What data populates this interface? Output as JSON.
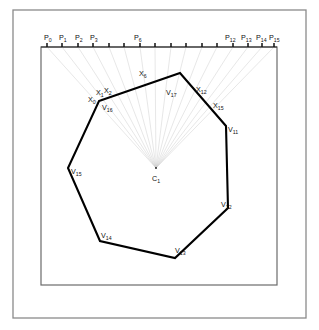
{
  "figure": {
    "center_label": "C",
    "center_sub": "1",
    "frame": {
      "outer": {
        "x": 13,
        "y": 10,
        "w": 293,
        "h": 308
      },
      "inner": {
        "x": 41,
        "y": 47,
        "w": 236,
        "h": 238
      }
    },
    "axis": {
      "y": 47,
      "x_start": 41,
      "x_end": 277,
      "tick_count": 16,
      "tick_height": 4
    }
  },
  "ray_points": [
    {
      "id": "P0",
      "label": "P",
      "sub": "0",
      "x": 47,
      "y": 47,
      "label_shown": true,
      "label_x": 44,
      "label_y": 40
    },
    {
      "id": "P1",
      "label": "P",
      "sub": "1",
      "x": 62,
      "y": 47,
      "label_shown": true,
      "label_x": 59,
      "label_y": 40
    },
    {
      "id": "P2",
      "label": "P",
      "sub": "2",
      "x": 78,
      "y": 47,
      "label_shown": true,
      "label_x": 75,
      "label_y": 40
    },
    {
      "id": "P3",
      "label": "P",
      "sub": "3",
      "x": 93,
      "y": 47,
      "label_shown": true,
      "label_x": 90,
      "label_y": 40
    },
    {
      "id": "P4",
      "label": "P",
      "sub": "4",
      "x": 109,
      "y": 47,
      "label_shown": false,
      "label_x": 106,
      "label_y": 40
    },
    {
      "id": "P5",
      "label": "P",
      "sub": "5",
      "x": 124,
      "y": 47,
      "label_shown": false,
      "label_x": 121,
      "label_y": 40
    },
    {
      "id": "P6",
      "label": "P",
      "sub": "6",
      "x": 140,
      "y": 47,
      "label_shown": true,
      "label_x": 134,
      "label_y": 40
    },
    {
      "id": "P7",
      "label": "P",
      "sub": "7",
      "x": 155,
      "y": 47,
      "label_shown": false,
      "label_x": 152,
      "label_y": 40
    },
    {
      "id": "P8",
      "label": "P",
      "sub": "8",
      "x": 171,
      "y": 47,
      "label_shown": false,
      "label_x": 168,
      "label_y": 40
    },
    {
      "id": "P9",
      "label": "P",
      "sub": "9",
      "x": 186,
      "y": 47,
      "label_shown": false,
      "label_x": 183,
      "label_y": 40
    },
    {
      "id": "P10",
      "label": "P",
      "sub": "10",
      "x": 202,
      "y": 47,
      "label_shown": false,
      "label_x": 197,
      "label_y": 40
    },
    {
      "id": "P11",
      "label": "P",
      "sub": "11",
      "x": 217,
      "y": 47,
      "label_shown": false,
      "label_x": 212,
      "label_y": 40
    },
    {
      "id": "P12",
      "label": "P",
      "sub": "12",
      "x": 233,
      "y": 47,
      "label_shown": true,
      "label_x": 225,
      "label_y": 40
    },
    {
      "id": "P13",
      "label": "P",
      "sub": "13",
      "x": 248,
      "y": 47,
      "label_shown": true,
      "label_x": 241,
      "label_y": 40
    },
    {
      "id": "P14",
      "label": "P",
      "sub": "14",
      "x": 262,
      "y": 47,
      "label_shown": true,
      "label_x": 256,
      "label_y": 40
    },
    {
      "id": "P15",
      "label": "P",
      "sub": "15",
      "x": 274,
      "y": 47,
      "label_shown": true,
      "label_x": 269,
      "label_y": 40
    }
  ],
  "center": {
    "x": 156,
    "y": 168
  },
  "polygon": {
    "closed": true,
    "vertices": [
      {
        "id": "V16",
        "label": "V",
        "sub": "16",
        "x": 99,
        "y": 101,
        "label_x": 102,
        "label_y": 110
      },
      {
        "id": "V17",
        "label": "V",
        "sub": "17",
        "x": 180,
        "y": 73,
        "label_x": 166,
        "label_y": 95
      },
      {
        "id": "V11",
        "label": "V",
        "sub": "11",
        "x": 226,
        "y": 126,
        "label_x": 228,
        "label_y": 132
      },
      {
        "id": "V12",
        "label": "V",
        "sub": "12",
        "x": 228,
        "y": 208,
        "label_x": 221,
        "label_y": 207
      },
      {
        "id": "V13",
        "label": "V",
        "sub": "13",
        "x": 175,
        "y": 258,
        "label_x": 175,
        "label_y": 253
      },
      {
        "id": "V14",
        "label": "V",
        "sub": "14",
        "x": 100,
        "y": 241,
        "label_x": 101,
        "label_y": 238
      },
      {
        "id": "V15",
        "label": "V",
        "sub": "15",
        "x": 68,
        "y": 168,
        "label_x": 71,
        "label_y": 174
      }
    ]
  },
  "intersection_labels": [
    {
      "id": "X0",
      "label": "X",
      "sub": "0",
      "x": 88,
      "y": 102
    },
    {
      "id": "X1",
      "label": "X",
      "sub": "1",
      "x": 96,
      "y": 95
    },
    {
      "id": "X2",
      "label": "X",
      "sub": "2",
      "x": 104,
      "y": 93
    },
    {
      "id": "X6",
      "label": "X",
      "sub": "6",
      "x": 139,
      "y": 76
    },
    {
      "id": "X12",
      "label": "X",
      "sub": "12",
      "x": 196,
      "y": 92
    },
    {
      "id": "X15",
      "label": "X",
      "sub": "15",
      "x": 213,
      "y": 108
    }
  ],
  "colors": {
    "ray": "#c9c9c9",
    "polygon": "#000000",
    "frame_outer": "#8a8a8a",
    "frame_inner": "#6b6b6b",
    "text": "#111111",
    "background": "#ffffff"
  }
}
